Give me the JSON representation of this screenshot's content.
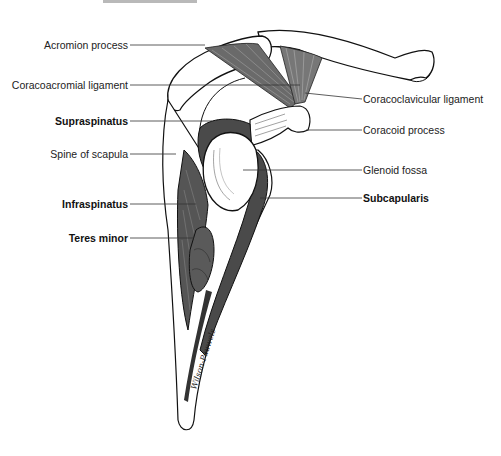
{
  "diagram": {
    "labels_left": [
      {
        "id": "acromion",
        "text": "Acromion process",
        "bold": false
      },
      {
        "id": "coracoacromial",
        "text": "Coracoacromial ligament",
        "bold": false
      },
      {
        "id": "supraspinatus",
        "text": "Supraspinatus",
        "bold": true
      },
      {
        "id": "spine",
        "text": "Spine of scapula",
        "bold": false
      },
      {
        "id": "infraspinatus",
        "text": "Infraspinatus",
        "bold": true
      },
      {
        "id": "teres_minor",
        "text": "Teres minor",
        "bold": true
      }
    ],
    "labels_right": [
      {
        "id": "coracoclavicular",
        "text": "Coracoclavicular ligament",
        "bold": false
      },
      {
        "id": "coracoid",
        "text": "Coracoid process",
        "bold": false
      },
      {
        "id": "glenoid",
        "text": "Glenoid fossa",
        "bold": false
      },
      {
        "id": "subscapularis",
        "text": "Subcapularis",
        "bold": true
      }
    ],
    "signature": "Wilson-Pauwels",
    "colors": {
      "muscle": "#5a5a5a",
      "muscle_dark": "#3a3a3a",
      "bone": "#ffffff",
      "line": "#111111",
      "leader": "#333333"
    }
  }
}
